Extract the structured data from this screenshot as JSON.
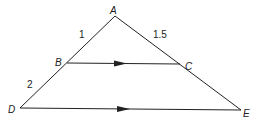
{
  "diagram": {
    "type": "geometry-similar-triangles",
    "points": {
      "A": {
        "label": "A",
        "x": 115,
        "y": 16
      },
      "B": {
        "label": "B",
        "x": 67,
        "y": 63
      },
      "C": {
        "label": "C",
        "x": 180,
        "y": 64
      },
      "D": {
        "label": "D",
        "x": 20,
        "y": 108
      },
      "E": {
        "label": "E",
        "x": 241,
        "y": 110
      }
    },
    "segments": [
      {
        "from": "A",
        "to": "D"
      },
      {
        "from": "A",
        "to": "E"
      },
      {
        "from": "B",
        "to": "C",
        "parallel_arrow": true
      },
      {
        "from": "D",
        "to": "E",
        "parallel_arrow": true
      }
    ],
    "lengths": {
      "AB": "1",
      "AC": "1.5",
      "BD": "2"
    },
    "colors": {
      "stroke": "#222222",
      "background": "#ffffff"
    }
  }
}
